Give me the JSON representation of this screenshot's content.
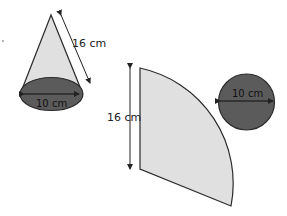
{
  "cone": {
    "slant_label": "16 cm",
    "base_label": "10 cm"
  },
  "net": {
    "radius_label": "16 cm",
    "circle_label": "10 cm"
  },
  "colors": {
    "surface_fill": "#e0e0e0",
    "base_fill": "#5b5b5b",
    "stroke": "#2a2a2a"
  }
}
